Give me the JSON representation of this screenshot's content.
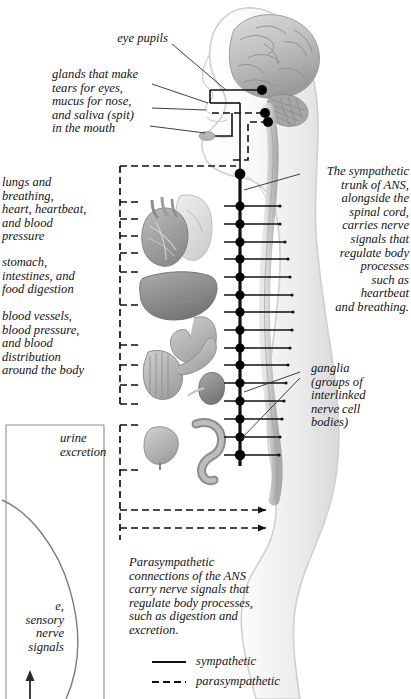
{
  "figure": {
    "colors": {
      "body_outline": "#cfcfcf",
      "body_fill": "#f4f4f4",
      "brain_fill": "#cbcbcb",
      "brain_shade": "#a8a8a8",
      "organ_mid": "#9a9a9a",
      "organ_light": "#c4c4c4",
      "organ_dark": "#7a7a7a",
      "nerve_line": "#111111",
      "ganglion": "#000000",
      "text": "#141414",
      "background": "#ffffff"
    }
  },
  "callouts": {
    "eye_pupils": "eye pupils",
    "glands": "glands that make\ntears for eyes,\nmucus for nose,\nand saliva (spit)\nin the mouth",
    "lungs_heart": "lungs and\nbreathing,\nheart, heartbeat,\nand blood\npressure",
    "stomach": "stomach,\nintestines, and\nfood digestion",
    "blood_vessels": "blood vessels,\nblood pressure,\nand blood\ndistribution\naround the body",
    "urine": "urine\nexcretion",
    "sympathetic_trunk": "The sympathetic\ntrunk of ANS,\nalongside the\nspinal cord,\ncarries nerve\nsignals that\nregulate body\nprocesses\nsuch as\nheartbeat\nand breathing.",
    "ganglia": "ganglia\n(groups of\ninterlinked\nnerve cell\nbodies)",
    "parasympathetic_note": "Parasympathetic\nconnections of the ANS\ncarry nerve signals that\nregulate body processes,\nsuch as digestion and\nexcretion.",
    "clipped_sensory_note": "e,\nsensory\nnerve\nsignals"
  },
  "legend": {
    "items": [
      {
        "label": "sympathetic",
        "style": "solid"
      },
      {
        "label": "parasympathetic",
        "style": "dashed"
      }
    ]
  },
  "anatomy": {
    "organ_labels": [
      "brain",
      "cerebellum",
      "salivary-gland",
      "heart",
      "lung",
      "liver",
      "stomach",
      "intestines",
      "kidney",
      "bladder",
      "colon",
      "spinal-cord",
      "sympathetic-trunk"
    ],
    "ganglia_count": 16,
    "cranial_ganglia_count": 3
  }
}
